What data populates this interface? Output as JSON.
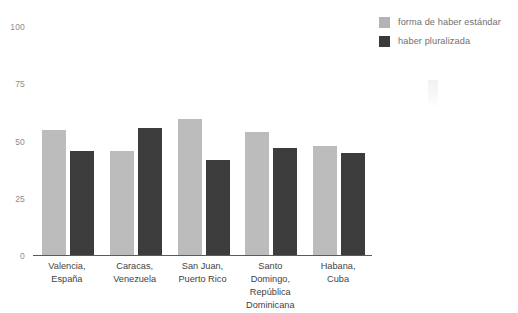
{
  "chart_data": {
    "type": "bar",
    "title": "",
    "xlabel": "",
    "ylabel": "",
    "ylim": [
      0,
      100
    ],
    "yticks": [
      0,
      25,
      50,
      75,
      100
    ],
    "ytick_labels": [
      "0",
      "25",
      "50",
      "75",
      "100"
    ],
    "grid": false,
    "legend_position": "right",
    "categories": [
      "Valencia, España",
      "Caracas, Venezuela",
      "San Juan, Puerto Rico",
      "Santo Domingo, República Dominicana",
      "Habana, Cuba"
    ],
    "category_lines": [
      [
        "Valencia,",
        "España"
      ],
      [
        "Caracas,",
        "Venezuela"
      ],
      [
        "San Juan,",
        "Puerto Rico"
      ],
      [
        "Santo",
        "Domingo,",
        "República",
        "Dominicana"
      ],
      [
        "Habana,",
        "Cuba"
      ]
    ],
    "series": [
      {
        "name": "forma de haber estándar",
        "color": "#bcbcbc",
        "values": [
          55,
          46,
          60,
          54,
          48
        ]
      },
      {
        "name": "haber pluralizada",
        "color": "#3c3c3c",
        "values": [
          46,
          56,
          42,
          47,
          45
        ]
      }
    ]
  },
  "legend": {
    "items": [
      {
        "label": "forma de haber estándar",
        "swatch": "light"
      },
      {
        "label": "haber pluralizada",
        "swatch": "dark"
      }
    ]
  },
  "axis": {
    "tick_100": "100",
    "tick_75": "75",
    "tick_50": "50",
    "tick_25": "25",
    "tick_0": "0"
  },
  "colors": {
    "series_light": "#bcbcbc",
    "series_dark": "#3c3c3c",
    "axis": "#5a5a5a",
    "tick_text": "#8d8d8d",
    "label_text": "#3f3f3f",
    "legend_text": "#6f6f6f",
    "background": "#ffffff"
  }
}
